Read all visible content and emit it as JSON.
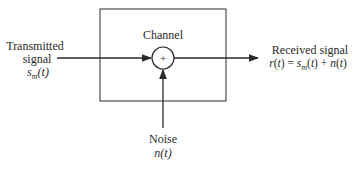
{
  "diagram": {
    "type": "block-diagram",
    "block": {
      "label": "Channel"
    },
    "adder": {
      "symbol": "+"
    },
    "input": {
      "label_line1": "Transmitted",
      "label_line2": "signal",
      "expr": "s_m(t)",
      "expr_display": "sm(t)"
    },
    "noise": {
      "label": "Noise",
      "expr": "n(t)"
    },
    "output": {
      "label": "Received signal",
      "expr": "r(t) = s_m(t) + n(t)"
    },
    "colors": {
      "line": "#2a2a2a",
      "background": "#ffffff"
    }
  }
}
